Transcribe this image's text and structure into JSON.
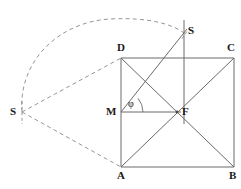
{
  "figure": {
    "width": 241,
    "height": 189,
    "background_color": "#ffffff",
    "stroke_color": "#555555",
    "dashed_stroke_color": "#7a7a7a",
    "label_color": "#1a1a1a"
  },
  "labels": {
    "D": "D",
    "C": "C",
    "A": "A",
    "B": "B",
    "M": "M",
    "F": "F",
    "S_top": "S",
    "S_left": "S",
    "phi": "φ"
  },
  "points": {
    "D": {
      "x": 121,
      "y": 58
    },
    "C": {
      "x": 234,
      "y": 58
    },
    "A": {
      "x": 121,
      "y": 167
    },
    "B": {
      "x": 234,
      "y": 167
    },
    "M": {
      "x": 121,
      "y": 112
    },
    "F": {
      "x": 177,
      "y": 112
    },
    "S_top": {
      "x": 184,
      "y": 33
    },
    "S_left": {
      "x": 22,
      "y": 112
    }
  },
  "label_positions": {
    "D": {
      "x": 117,
      "y": 42
    },
    "C": {
      "x": 227,
      "y": 42
    },
    "A": {
      "x": 117,
      "y": 170
    },
    "B": {
      "x": 229,
      "y": 170
    },
    "M": {
      "x": 106,
      "y": 106
    },
    "F": {
      "x": 182,
      "y": 106
    },
    "S_top": {
      "x": 188,
      "y": 25
    },
    "S_left": {
      "x": 10,
      "y": 106
    },
    "phi": {
      "x": 128,
      "y": 99
    }
  },
  "segments": [
    {
      "name": "square-side-top-DC",
      "from": "D",
      "to": "C",
      "style": "solid"
    },
    {
      "name": "square-side-right-CB",
      "from": "C",
      "to": "B",
      "style": "solid"
    },
    {
      "name": "square-side-bottom-AB",
      "from": "A",
      "to": "B",
      "style": "solid"
    },
    {
      "name": "square-side-left-DA",
      "from": "D",
      "to": "A",
      "style": "solid"
    },
    {
      "name": "diagonal-AC",
      "from": "A",
      "to": "C",
      "style": "solid"
    },
    {
      "name": "diagonal-DB",
      "from": "D",
      "to": "B",
      "style": "solid"
    },
    {
      "name": "segment-MF",
      "from": "M",
      "to": "F",
      "style": "solid"
    },
    {
      "name": "ray-M-to-S-top",
      "from": "M",
      "to": "S_top",
      "style": "solid"
    },
    {
      "name": "vertical-line-through-S-top",
      "from": "S_top_up",
      "to": "F_below",
      "style": "solid"
    }
  ],
  "dashed_elements": [
    {
      "name": "arc-S-left-to-S-top",
      "description": "dashed circular arc from left S point over the top to the upper S point"
    },
    {
      "name": "dashed-line-S-left-to-D",
      "from": "S_left",
      "to": "D"
    },
    {
      "name": "dashed-line-S-left-to-A",
      "from": "S_left",
      "to": "A"
    },
    {
      "name": "tick-S-left",
      "description": "short dashed tick mark crossing at left S"
    },
    {
      "name": "tick-S-top",
      "description": "short dashed tick mark crossing at top S"
    }
  ],
  "angle": {
    "name": "phi",
    "symbol": "φ",
    "vertex": "M",
    "from_ray": "MF",
    "to_ray": "M-to-S-top",
    "arc_radius": 22
  }
}
